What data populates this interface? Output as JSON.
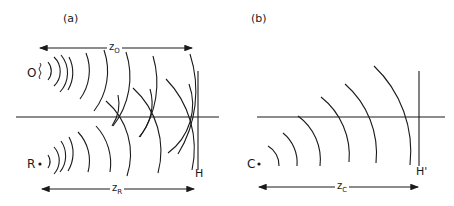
{
  "panels": [
    {
      "id": "a",
      "label": "(a)",
      "sources": [
        {
          "label": "O",
          "description": "object point source with wavy marker"
        },
        {
          "label": "R",
          "description": "reference point source"
        }
      ],
      "hologram_label": "H",
      "distances": [
        {
          "symbol": "z",
          "subscript": "O"
        },
        {
          "symbol": "z",
          "subscript": "R"
        }
      ]
    },
    {
      "id": "b",
      "label": "(b)",
      "sources": [
        {
          "label": "C",
          "description": "reconstruction point source"
        }
      ],
      "hologram_label": "H'",
      "distances": [
        {
          "symbol": "z",
          "subscript": "C"
        }
      ]
    }
  ],
  "colors": {
    "line": "#1a1a1a",
    "background": "#ffffff"
  }
}
